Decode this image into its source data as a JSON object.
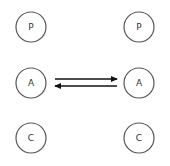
{
  "diagram": {
    "type": "transactional-analysis",
    "left_person": {
      "states": [
        {
          "key": "parent",
          "label": "P"
        },
        {
          "key": "adult",
          "label": "A"
        },
        {
          "key": "child",
          "label": "C"
        }
      ]
    },
    "right_person": {
      "states": [
        {
          "key": "parent",
          "label": "P"
        },
        {
          "key": "adult",
          "label": "A"
        },
        {
          "key": "child",
          "label": "C"
        }
      ]
    },
    "transactions": [
      {
        "from": "left.adult",
        "to": "right.adult",
        "direction": "right"
      },
      {
        "from": "right.adult",
        "to": "left.adult",
        "direction": "left"
      }
    ],
    "colors": {
      "circle_stroke": "#555555",
      "arrow": "#111111",
      "text": "#333333",
      "background": "#ffffff"
    }
  }
}
